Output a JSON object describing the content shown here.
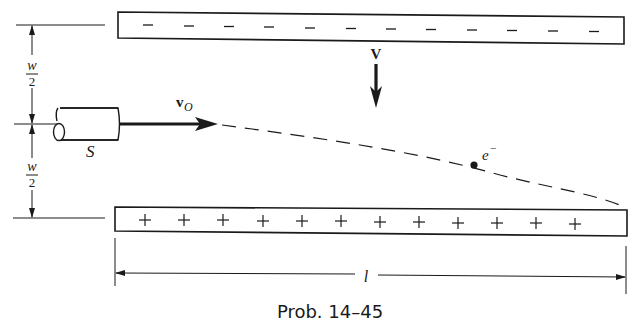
{
  "diagram": {
    "type": "physics-figure",
    "caption": "Prob. 14–45",
    "top_plate": {
      "charge_sign": "−",
      "count": 12,
      "polarity": "negative"
    },
    "bottom_plate": {
      "charge_sign": "+",
      "count": 12,
      "polarity": "positive"
    },
    "labels": {
      "half_width_top": {
        "numerator": "w",
        "denominator": "2"
      },
      "half_width_bottom": {
        "numerator": "w",
        "denominator": "2"
      },
      "source": "S",
      "initial_velocity": {
        "symbol": "v",
        "subscript": "O"
      },
      "potential": "V",
      "electron": {
        "symbol": "e",
        "superscript": "−"
      },
      "length": "l"
    },
    "colors": {
      "ink": "#1a1a1a",
      "background": "#ffffff"
    }
  }
}
